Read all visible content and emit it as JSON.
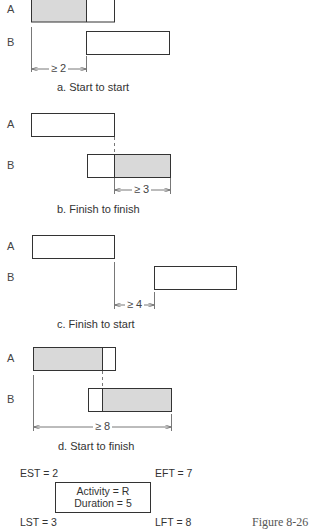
{
  "diagrams": [
    {
      "id": "a",
      "caption": "a. Start to start",
      "row_a_label": "A",
      "row_b_label": "B",
      "dimension_label": "≥ 2"
    },
    {
      "id": "b",
      "caption": "b. Finish to finish",
      "row_a_label": "A",
      "row_b_label": "B",
      "dimension_label": "≥ 3"
    },
    {
      "id": "c",
      "caption": "c. Finish to start",
      "row_a_label": "A",
      "row_b_label": "B",
      "dimension_label": "≥ 4"
    },
    {
      "id": "d",
      "caption": "d. Start to finish",
      "row_a_label": "A",
      "row_b_label": "B",
      "dimension_label": "≥ 8"
    }
  ],
  "node_legend": {
    "est": "EST = 2",
    "eft": "EFT = 7",
    "lst": "LST = 3",
    "lft": "LFT = 8",
    "activity": "Activity = R",
    "duration": "Duration = 5"
  },
  "figure_label": "Figure 8-26",
  "colors": {
    "stroke": "#333333",
    "fill_shaded": "#d9d9d9",
    "background": "#ffffff"
  }
}
